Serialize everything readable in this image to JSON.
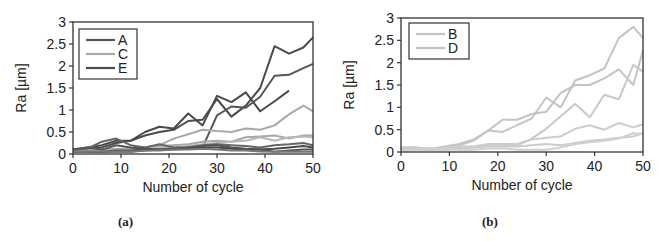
{
  "chart_data": [
    {
      "type": "line",
      "panel": "a",
      "caption": "(a)",
      "title": "",
      "xlabel": "Number of cycle",
      "ylabel": "Ra [µm]",
      "xlim": [
        0,
        50
      ],
      "ylim": [
        0,
        3
      ],
      "xticks": [
        "0",
        "10",
        "20",
        "30",
        "40",
        "50"
      ],
      "yticks": [
        "0",
        "0.5",
        "1",
        "1.5",
        "2",
        "2.5",
        "3"
      ],
      "grid": false,
      "legend": {
        "position": "upper-left",
        "entries": [
          {
            "label": "A",
            "color": "#555555"
          },
          {
            "label": "C",
            "color": "#a8a8a8"
          },
          {
            "label": "E",
            "color": "#4a4a4a"
          }
        ]
      },
      "x": [
        0,
        3,
        6,
        9,
        12,
        15,
        18,
        21,
        24,
        27,
        30,
        33,
        36,
        39,
        42,
        45,
        48,
        50
      ],
      "series": [
        {
          "name": "E-1",
          "group": "E",
          "color": "#4a4a4a",
          "values": [
            0.1,
            0.15,
            0.2,
            0.3,
            0.3,
            0.5,
            0.62,
            0.58,
            0.92,
            0.65,
            1.32,
            1.18,
            1.4,
            0.97,
            1.2,
            1.44,
            null,
            null
          ]
        },
        {
          "name": "E-2",
          "group": "E",
          "color": "#4a4a4a",
          "values": [
            0.08,
            0.12,
            0.15,
            0.25,
            0.3,
            0.42,
            0.5,
            0.55,
            0.75,
            0.78,
            1.25,
            0.85,
            1.1,
            1.5,
            2.45,
            2.28,
            2.42,
            2.65
          ]
        },
        {
          "name": "A-1",
          "group": "A",
          "color": "#555555",
          "values": [
            0.05,
            0.05,
            0.05,
            0.05,
            0.05,
            0.08,
            0.1,
            0.12,
            0.12,
            0.15,
            0.88,
            1.08,
            1.05,
            1.3,
            1.78,
            1.8,
            1.95,
            2.05
          ]
        },
        {
          "name": "C-1",
          "group": "C",
          "color": "#a8a8a8",
          "values": [
            0.08,
            0.1,
            0.1,
            0.12,
            0.12,
            0.15,
            0.2,
            0.35,
            0.45,
            0.55,
            0.52,
            0.5,
            0.58,
            0.55,
            0.65,
            0.9,
            1.1,
            0.97
          ]
        },
        {
          "name": "C-2",
          "group": "C",
          "color": "#a8a8a8",
          "values": [
            0.05,
            0.08,
            0.1,
            0.1,
            0.12,
            0.15,
            0.18,
            0.2,
            0.22,
            0.28,
            0.3,
            0.28,
            0.38,
            0.4,
            0.42,
            0.35,
            0.42,
            0.42
          ]
        },
        {
          "name": "C-3",
          "group": "C",
          "color": "#b8b8b8",
          "values": [
            0.05,
            0.06,
            0.08,
            0.08,
            0.1,
            0.12,
            0.15,
            0.15,
            0.18,
            0.22,
            0.25,
            0.28,
            0.3,
            0.38,
            0.3,
            0.38,
            0.4,
            0.38
          ]
        },
        {
          "name": "A-2",
          "group": "A",
          "color": "#666666",
          "values": [
            0.1,
            0.12,
            0.28,
            0.35,
            0.2,
            0.15,
            0.22,
            0.15,
            0.15,
            0.2,
            0.22,
            0.2,
            0.18,
            0.15,
            0.2,
            0.22,
            0.25,
            0.2
          ]
        },
        {
          "name": "A-3",
          "group": "A",
          "color": "#555555",
          "values": [
            0.1,
            0.15,
            0.1,
            0.2,
            0.15,
            0.12,
            0.1,
            0.12,
            0.15,
            0.18,
            0.2,
            0.15,
            0.12,
            0.1,
            0.05,
            0.08,
            0.1,
            0.1
          ]
        },
        {
          "name": "E-3",
          "group": "E",
          "color": "#4a4a4a",
          "values": [
            0.05,
            0.05,
            0.05,
            0.08,
            0.08,
            0.1,
            0.1,
            0.1,
            0.12,
            0.15,
            0.15,
            0.12,
            0.1,
            0.1,
            0.12,
            0.15,
            0.18,
            0.15
          ]
        },
        {
          "name": "A-4",
          "group": "A",
          "color": "#777777",
          "values": [
            0.05,
            0.05,
            0.06,
            0.06,
            0.06,
            0.08,
            0.08,
            0.1,
            0.1,
            0.12,
            0.1,
            0.08,
            0.08,
            0.06,
            0.05,
            0.05,
            0.05,
            0.05
          ]
        }
      ]
    },
    {
      "type": "line",
      "panel": "b",
      "caption": "(b)",
      "title": "",
      "xlabel": "Number of cycle",
      "ylabel": "Ra [µm]",
      "xlim": [
        0,
        50
      ],
      "ylim": [
        0,
        3
      ],
      "xticks": [
        "0",
        "10",
        "20",
        "30",
        "40",
        "50"
      ],
      "yticks": [
        "0",
        "0.5",
        "1",
        "1.5",
        "2",
        "2.5",
        "3"
      ],
      "grid": false,
      "legend": {
        "position": "upper-left",
        "entries": [
          {
            "label": "B",
            "color": "#c4c4c4"
          },
          {
            "label": "D",
            "color": "#c4c4c4"
          }
        ]
      },
      "x": [
        0,
        3,
        6,
        9,
        12,
        15,
        18,
        21,
        24,
        27,
        30,
        33,
        36,
        39,
        42,
        45,
        48,
        50
      ],
      "series": [
        {
          "name": "B-1",
          "group": "B",
          "color": "#c4c4c4",
          "values": [
            0.1,
            0.1,
            0.05,
            0.1,
            0.15,
            0.25,
            0.48,
            0.72,
            0.72,
            0.85,
            0.9,
            1.32,
            1.5,
            1.5,
            1.65,
            1.85,
            1.5,
            2.28
          ]
        },
        {
          "name": "B-2",
          "group": "B",
          "color": "#c4c4c4",
          "values": [
            0.08,
            0.1,
            0.06,
            0.12,
            0.18,
            0.28,
            0.48,
            0.45,
            0.6,
            0.75,
            1.22,
            1.0,
            1.6,
            1.72,
            1.87,
            2.55,
            2.8,
            2.55
          ]
        },
        {
          "name": "D-1",
          "group": "D",
          "color": "#c8c8c8",
          "values": [
            0.05,
            0.08,
            0.08,
            0.1,
            0.1,
            0.1,
            0.15,
            0.15,
            0.15,
            0.3,
            0.52,
            0.8,
            1.08,
            0.78,
            1.28,
            1.18,
            1.95,
            1.8
          ]
        },
        {
          "name": "D-2",
          "group": "D",
          "color": "#cccccc",
          "values": [
            0.1,
            0.1,
            0.08,
            0.1,
            0.12,
            0.12,
            0.18,
            0.18,
            0.18,
            0.28,
            0.32,
            0.35,
            0.52,
            0.6,
            0.5,
            0.65,
            0.55,
            0.62
          ]
        },
        {
          "name": "B-3",
          "group": "B",
          "color": "#cccccc",
          "values": [
            0.05,
            0.05,
            0.05,
            0.05,
            0.08,
            0.1,
            0.12,
            0.12,
            0.12,
            0.15,
            0.18,
            0.15,
            0.2,
            0.25,
            0.28,
            0.32,
            0.35,
            0.42
          ]
        },
        {
          "name": "D-3",
          "group": "D",
          "color": "#d0d0d0",
          "values": [
            0.05,
            0.05,
            0.05,
            0.05,
            0.05,
            0.05,
            0.08,
            0.08,
            0.05,
            0.05,
            0.05,
            0.1,
            0.18,
            0.22,
            0.25,
            0.3,
            0.42,
            0.4
          ]
        }
      ]
    }
  ]
}
